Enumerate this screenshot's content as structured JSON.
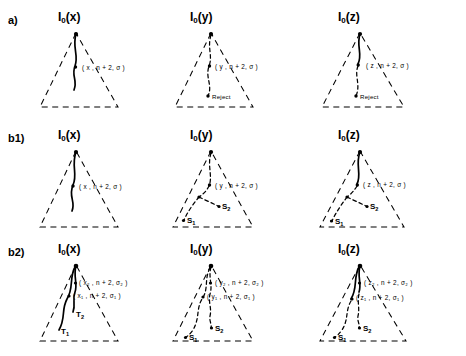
{
  "figure": {
    "rows": [
      {
        "id": "a",
        "label": "a)",
        "panels": [
          {
            "id": "a-x",
            "title_main": "I",
            "title_sub": "0",
            "title_arg": "(x)",
            "param_labels": [
              "( x , n + 2, σ )"
            ],
            "end_labels": []
          },
          {
            "id": "a-y",
            "title_main": "I",
            "title_sub": "0",
            "title_arg": "(y)",
            "param_labels": [
              "( y , n + 2, σ )"
            ],
            "end_labels": [
              "Reject"
            ]
          },
          {
            "id": "a-z",
            "title_main": "I",
            "title_sub": "0",
            "title_arg": "(z)",
            "param_labels": [
              "( z , n + 2, σ )"
            ],
            "end_labels": [
              "Reject"
            ]
          }
        ]
      },
      {
        "id": "b1",
        "label": "b1)",
        "panels": [
          {
            "id": "b1-x",
            "title_main": "I",
            "title_sub": "0",
            "title_arg": "(x)",
            "param_labels": [
              "( x , n + 2, σ )"
            ],
            "end_labels": []
          },
          {
            "id": "b1-y",
            "title_main": "I",
            "title_sub": "0",
            "title_arg": "(y)",
            "param_labels": [
              "( y , n + 2, σ )"
            ],
            "end_labels": [
              "S",
              "S"
            ],
            "end_subs": [
              "2",
              "1"
            ]
          },
          {
            "id": "b1-z",
            "title_main": "I",
            "title_sub": "0",
            "title_arg": "(z)",
            "param_labels": [
              "( z , n + 2, σ )"
            ],
            "end_labels": [
              "S",
              "S"
            ],
            "end_subs": [
              "2",
              "1"
            ]
          }
        ]
      },
      {
        "id": "b2",
        "label": "b2)",
        "panels": [
          {
            "id": "b2-x",
            "title_main": "I",
            "title_sub": "0",
            "title_arg": "(x)",
            "param_labels": [
              "( x",
              "2",
              ", n + 2, σ",
              "2",
              " )",
              "( x",
              "1",
              ", n + 2, σ",
              "1",
              " )"
            ],
            "param_upper": "( x₂ , n + 2, σ₂ )",
            "param_lower": "( x₁ , n + 2, σ₁ )",
            "end_labels": [
              "T",
              "T"
            ],
            "end_subs": [
              "2",
              "1"
            ]
          },
          {
            "id": "b2-y",
            "title_main": "I",
            "title_sub": "0",
            "title_arg": "(y)",
            "param_upper": "( y₂ , n + 2, σ₂ )",
            "param_lower": "( y₁ , n + 2, σ₁ )",
            "end_labels": [
              "S",
              "S"
            ],
            "end_subs": [
              "2",
              "1"
            ]
          },
          {
            "id": "b2-z",
            "title_main": "I",
            "title_sub": "0",
            "title_arg": "(z)",
            "param_upper": "( z₂ , n + 2, σ₂ )",
            "param_lower": "( z₁ , n + 2, σ₁ )",
            "end_labels": [
              "S",
              "S"
            ],
            "end_subs": [
              "2",
              "1"
            ]
          }
        ]
      }
    ],
    "symbols": {
      "sigma": "σ",
      "reject": "Reject",
      "s1": "S₁",
      "s2": "S₂",
      "t1": "T₁",
      "t2": "T₂"
    },
    "colors": {
      "ink": "#000000",
      "background": "#ffffff"
    }
  }
}
